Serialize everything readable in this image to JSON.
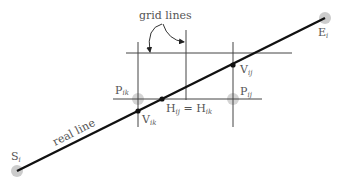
{
  "diagram": {
    "labels": {
      "grid_lines": "grid lines",
      "real_line": "real line",
      "start": {
        "main": "S",
        "sub": "i"
      },
      "end": {
        "main": "E",
        "sub": "i"
      },
      "p_ik": {
        "main": "P",
        "sub": "ik"
      },
      "p_ij": {
        "main": "P",
        "sub": "ij"
      },
      "v_ij": {
        "main": "V",
        "sub": "ij"
      },
      "v_ik": {
        "main": "V",
        "sub": "ik"
      },
      "h_eq": {
        "main1": "H",
        "sub1": "ij",
        "eq": " = ",
        "main2": "H",
        "sub2": "ik"
      }
    },
    "colors": {
      "real_line": "#111111",
      "grid_line": "#444444",
      "endpoint_halo": "#cccccc",
      "text": "#555555"
    }
  }
}
